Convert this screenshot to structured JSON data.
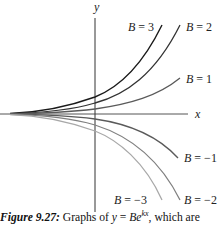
{
  "chart_data": {
    "type": "line",
    "title": "",
    "xlabel": "x",
    "ylabel": "y",
    "grid": false,
    "legend": "inline labels at curve ends",
    "function": "y = B e^{kx}",
    "series": [
      {
        "name": "B = 3",
        "B": 3,
        "color": "#1a1a1a"
      },
      {
        "name": "B = 2",
        "B": 2,
        "color": "#333333"
      },
      {
        "name": "B = 1",
        "B": 1,
        "color": "#5a5a5a"
      },
      {
        "name": "B = -1",
        "B": -1,
        "color": "#5a5a5a"
      },
      {
        "name": "B = -2",
        "B": -2,
        "color": "#808080"
      },
      {
        "name": "B = -3",
        "B": -3,
        "color": "#a8a8a8"
      }
    ]
  },
  "figure": {
    "axis_x_label": "x",
    "axis_y_label": "y",
    "labels": {
      "b3": "B = 3",
      "b2": "B = 2",
      "b1": "B = 1",
      "bm1": "B = −1",
      "bm2": "B = −2",
      "bm3": "B = −3"
    }
  },
  "caption": {
    "figure_label": "Figure 9.27:",
    "text_before": " Graphs of ",
    "math_lhs": "y",
    "equals": " = ",
    "math_base": "Be",
    "exponent": "kx",
    "text_after": ", which are"
  }
}
